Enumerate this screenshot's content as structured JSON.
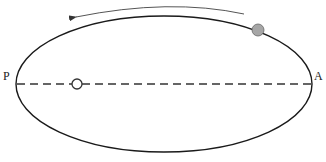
{
  "diagram": {
    "type": "elliptical-orbit",
    "labels": {
      "perihelion": "P",
      "aphelion": "A"
    },
    "orbit": {
      "cx": 164,
      "cy": 84,
      "rx": 148,
      "ry": 68,
      "stroke": "#1a1a1a"
    },
    "major_axis": {
      "style": "dashed",
      "stroke": "#333333"
    },
    "focus": {
      "type": "hollow-circle",
      "cx": 77,
      "cy": 84,
      "r": 5
    },
    "body": {
      "type": "filled-circle",
      "cx": 258,
      "cy": 30,
      "r": 6,
      "fill": "#a6a6a6"
    },
    "motion_arrow": {
      "direction": "counterclockwise",
      "stroke": "#555555"
    }
  }
}
